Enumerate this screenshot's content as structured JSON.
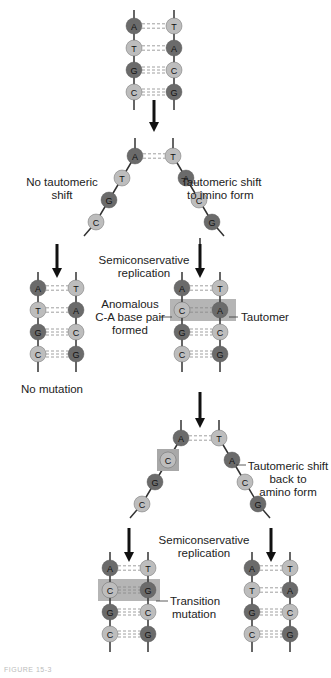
{
  "colors": {
    "purine_dark": "#6b6b6b",
    "pyrimidine_light": "#bdbdbd",
    "highlight_box": "#a8a8a8",
    "strand": "#333333",
    "hbond": "#888888",
    "arrow": "#111111"
  },
  "labels": {
    "no_shift": [
      "No tautomeric",
      "shift"
    ],
    "shift_imino": [
      "Tautomeric shift",
      "to imino form"
    ],
    "semi1": [
      "Semiconservative",
      "replication"
    ],
    "anomalous": [
      "Anomalous",
      "C-A base pair",
      "formed"
    ],
    "tautomer": "Tautomer",
    "no_mutation": "No mutation",
    "shift_back": [
      "Tautomeric shift",
      "back to",
      "amino form"
    ],
    "semi2": [
      "Semiconservative",
      "replication"
    ],
    "transition": [
      "Transition",
      "mutation"
    ],
    "caption": "FIGURE 15-3"
  },
  "stages": {
    "original": [
      [
        "A",
        "T"
      ],
      [
        "T",
        "A"
      ],
      [
        "G",
        "C"
      ],
      [
        "C",
        "G"
      ]
    ],
    "separated_1": {
      "left": [
        "A",
        "T",
        "G",
        "C"
      ],
      "right": [
        "T",
        "A",
        "C",
        "G"
      ]
    },
    "no_mutation": [
      [
        "A",
        "T"
      ],
      [
        "T",
        "A"
      ],
      [
        "G",
        "C"
      ],
      [
        "C",
        "G"
      ]
    ],
    "anomalous": [
      [
        "A",
        "T"
      ],
      [
        "C",
        "A"
      ],
      [
        "G",
        "C"
      ],
      [
        "C",
        "G"
      ]
    ],
    "separated_2": {
      "left": [
        "A",
        "C",
        "G",
        "C"
      ],
      "right": [
        "T",
        "A",
        "C",
        "G"
      ]
    },
    "transition": [
      [
        "A",
        "T"
      ],
      [
        "C",
        "G"
      ],
      [
        "G",
        "C"
      ],
      [
        "C",
        "G"
      ]
    ],
    "normal": [
      [
        "A",
        "T"
      ],
      [
        "T",
        "A"
      ],
      [
        "G",
        "C"
      ],
      [
        "C",
        "G"
      ]
    ]
  }
}
